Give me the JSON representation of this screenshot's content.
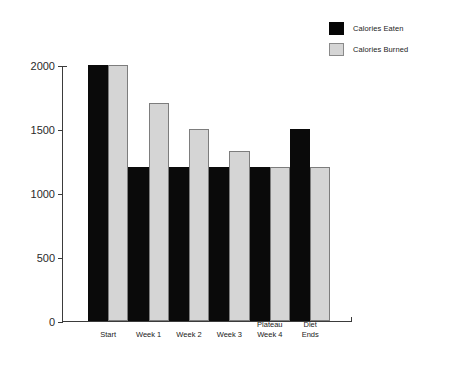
{
  "chart_data": {
    "type": "bar",
    "title": "",
    "xlabel": "",
    "ylabel": "",
    "ylim": [
      0,
      2000
    ],
    "yticks": [
      "0",
      "500",
      "1000",
      "1500",
      "2000"
    ],
    "ytick_values": [
      0,
      500,
      1000,
      1500,
      2000
    ],
    "grid": false,
    "legend_position": "top-right",
    "categories": [
      "Start",
      "Week 1",
      "Week 2",
      "Week 3",
      "Plateau Week 4",
      "Diet Ends"
    ],
    "category_lines": [
      [
        "Start",
        ""
      ],
      [
        "Week 1",
        ""
      ],
      [
        "Week 2",
        ""
      ],
      [
        "Week 3",
        ""
      ],
      [
        "Plateau",
        "Week 4"
      ],
      [
        "Diet",
        "Ends"
      ]
    ],
    "series": [
      {
        "name": "Calories Eaten",
        "color": "#0a0a0a",
        "values": [
          2000,
          1200,
          1200,
          1200,
          1200,
          1500
        ]
      },
      {
        "name": "Calories Burned",
        "color": "#d5d5d5",
        "values": [
          2000,
          1700,
          1500,
          1330,
          1200,
          1200
        ]
      }
    ]
  },
  "legend": {
    "entries": [
      {
        "label": "Calories Eaten",
        "swatch": "eaten"
      },
      {
        "label": "Calories Burned",
        "swatch": "burned"
      }
    ]
  },
  "colors": {
    "background": "#ffffff",
    "axis": "#3b3b3b",
    "eaten": "#0a0a0a",
    "burned_fill": "#d5d5d5",
    "burned_border": "#7d7d7d",
    "text": "#222222"
  }
}
